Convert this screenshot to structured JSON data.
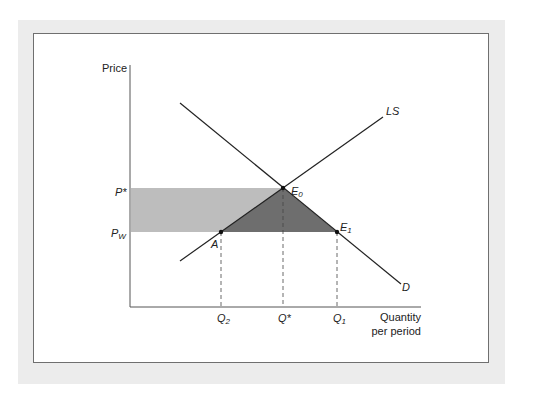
{
  "axes": {
    "y_label": "Price",
    "x_label_line1": "Quantity",
    "x_label_line2": "per period"
  },
  "curves": {
    "supply_label": "LS",
    "demand_label": "D"
  },
  "points": {
    "e0": {
      "base": "E",
      "sub": "0"
    },
    "e1": {
      "base": "E",
      "sub": "1"
    },
    "a": "A"
  },
  "price_ticks": {
    "p_star": "P*",
    "p_w": {
      "base": "P",
      "sub": "W"
    }
  },
  "quantity_ticks": {
    "q2": {
      "base": "Q",
      "sub": "2"
    },
    "q_star": "Q*",
    "q1": {
      "base": "Q",
      "sub": "1"
    }
  },
  "colors": {
    "light_rect": "#bdbdbd",
    "dark_triangle": "#6e6e6e",
    "line": "#222222",
    "frame": "#ececec"
  }
}
